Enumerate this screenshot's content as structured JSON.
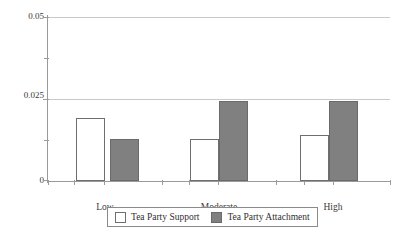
{
  "chart_data": {
    "type": "bar",
    "title": "",
    "subtitle": "",
    "xlabel": "",
    "ylabel": "",
    "categories": [
      "Low",
      "Moderate",
      "High"
    ],
    "series": [
      {
        "name": "Tea Party Support",
        "color": "#ffffff",
        "values": [
          0.0192,
          0.0128,
          0.014
        ]
      },
      {
        "name": "Tea Party Attachment",
        "color": "#808080",
        "values": [
          0.0128,
          0.0243,
          0.0244
        ]
      }
    ],
    "ylim": [
      0,
      0.05
    ],
    "yticks": [
      0,
      0.025,
      0.05
    ],
    "ytick_labels": [
      "0",
      "0.025",
      "0.05"
    ],
    "yminor_ticks": [
      0.0125,
      0.0375
    ],
    "grid": true,
    "grid_axis": "y",
    "legend_position": "bottom",
    "annotations": []
  },
  "axes": {
    "y_labels": {
      "top": "0.05",
      "middle": "0.025",
      "bottom": "0"
    },
    "x_labels": {
      "first": "Low",
      "second": "Moderate",
      "third": "High"
    }
  },
  "legend": {
    "entries": [
      {
        "label": "Tea Party Support"
      },
      {
        "label": "Tea Party Attachment"
      }
    ]
  },
  "colors": {
    "support_fill": "#ffffff",
    "attachment_fill": "#808080",
    "bar_stroke": "#6e6e6e",
    "axis": "#9a9a9a",
    "grid": "#c9c9c9",
    "text": "#3a3a3a",
    "background": "#ffffff"
  }
}
